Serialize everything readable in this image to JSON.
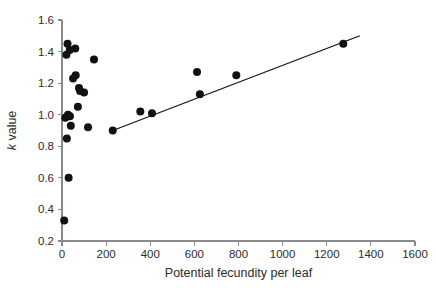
{
  "chart_data": {
    "type": "scatter",
    "title": "",
    "subtitle": "",
    "xlabel": "Potential fecundity per leaf",
    "ylabel": "k value",
    "ylabel_italic_prefix": "k",
    "ylabel_rest": " value",
    "xlim": [
      0,
      1600
    ],
    "ylim": [
      0.2,
      1.6
    ],
    "xticks": [
      0,
      200,
      400,
      600,
      800,
      1000,
      1200,
      1400,
      1600
    ],
    "xticklabels": [
      "0",
      "200",
      "400",
      "600",
      "800",
      "1000",
      "1200",
      "1400",
      "1600"
    ],
    "yticks": [
      0.2,
      0.4,
      0.6,
      0.8,
      1.0,
      1.2,
      1.4,
      1.6
    ],
    "yticklabels": [
      "0.2",
      "0.4",
      "0.6",
      "0.8",
      "1.0",
      "1.2",
      "1.4",
      "1.6"
    ],
    "grid": false,
    "legend": null,
    "legend_position": "none",
    "marker_color": "#111111",
    "marker_shape": "circle",
    "marker_size": 4.0,
    "axis_color": "#8a8a8a",
    "background_color": "#ffffff",
    "series": [
      {
        "name": "observations",
        "points": [
          {
            "x": 10,
            "y": 0.33
          },
          {
            "x": 30,
            "y": 0.6
          },
          {
            "x": 22,
            "y": 0.85
          },
          {
            "x": 40,
            "y": 0.93
          },
          {
            "x": 15,
            "y": 0.98
          },
          {
            "x": 27,
            "y": 1.0
          },
          {
            "x": 36,
            "y": 0.99
          },
          {
            "x": 72,
            "y": 1.05
          },
          {
            "x": 50,
            "y": 1.23
          },
          {
            "x": 62,
            "y": 1.25
          },
          {
            "x": 77,
            "y": 1.17
          },
          {
            "x": 82,
            "y": 1.15
          },
          {
            "x": 100,
            "y": 1.14
          },
          {
            "x": 118,
            "y": 0.92
          },
          {
            "x": 145,
            "y": 1.35
          },
          {
            "x": 20,
            "y": 1.38
          },
          {
            "x": 25,
            "y": 1.45
          },
          {
            "x": 35,
            "y": 1.41
          },
          {
            "x": 60,
            "y": 1.42
          },
          {
            "x": 230,
            "y": 0.9
          },
          {
            "x": 355,
            "y": 1.02
          },
          {
            "x": 408,
            "y": 1.01
          },
          {
            "x": 612,
            "y": 1.27
          },
          {
            "x": 625,
            "y": 1.13
          },
          {
            "x": 790,
            "y": 1.25
          },
          {
            "x": 1275,
            "y": 1.45
          }
        ]
      }
    ],
    "fit_line": {
      "name": "regression-line",
      "x_start": 230,
      "y_start": 0.9,
      "x_end": 1350,
      "y_end": 1.5,
      "color": "#111111"
    }
  }
}
